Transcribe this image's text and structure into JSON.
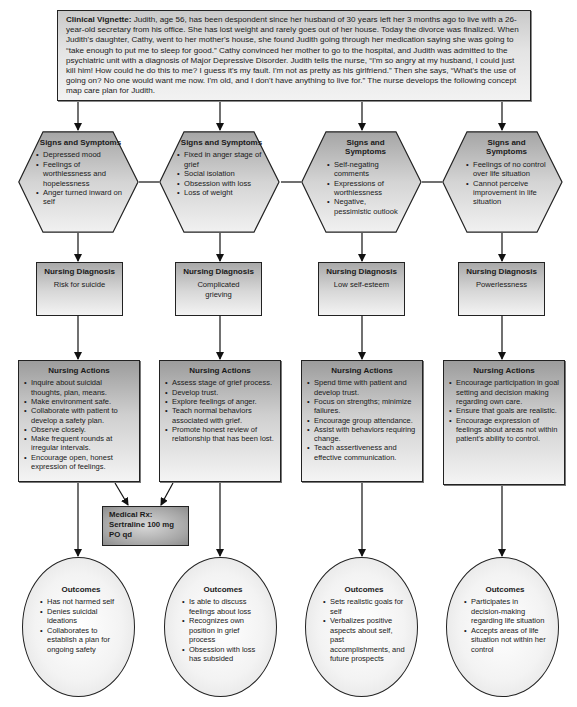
{
  "vignette": {
    "label": "Clinical Vignette:",
    "text": " Judith, age 56, has been despondent since her husband of 30 years left her 3 months ago to live with a 26-year-old secretary from his office. She has lost weight and rarely goes out of her house. Today the divorce was finalized. When Judith's daughter, Cathy, went to her mother's house, she found Judith going through her medication saying she was going to “take enough to put me to sleep for good.” Cathy convinced her mother to go to the hospital, and Judith was admitted to the psychiatric unit with a diagnosis of Major Depressive Disorder. Judith tells the nurse, “I'm so angry at my husband, I could just kill him! How could he do this to me? I guess it's my fault. I'm not as pretty as his girlfriend.” Then she says, “What's the use of going on? No one would want me now. I'm old, and I don't have anything to live for.” The nurse develops the following concept map care plan for Judith."
  },
  "columns": [
    {
      "signs": {
        "title": "Signs and Symptoms",
        "items": [
          "Depressed mood",
          "Feelings of worthlessness and hopelessness",
          "Anger turned inward on self"
        ]
      },
      "diagnosis": {
        "title": "Nursing Diagnosis",
        "text": "Risk for suicide"
      },
      "actions": {
        "title": "Nursing Actions",
        "items": [
          "Inquire about suicidal thoughts, plan, means.",
          "Make environment safe.",
          "Collaborate with patient to develop a safety plan.",
          "Observe closely.",
          "Make frequent rounds at irregular intervals.",
          "Encourage open, honest expression of feelings."
        ]
      },
      "outcomes": {
        "title": "Outcomes",
        "items": [
          "Has not harmed self",
          "Denies suicidal ideations",
          "Collaborates to establish a plan for ongoing safety"
        ]
      }
    },
    {
      "signs": {
        "title": "Signs and Symptoms",
        "items": [
          "Fixed in anger stage of grief",
          "Social isolation",
          "Obsession with loss",
          "Loss of weight"
        ]
      },
      "diagnosis": {
        "title": "Nursing Diagnosis",
        "text": "Complicated grieving"
      },
      "actions": {
        "title": "Nursing Actions",
        "items": [
          "Assess stage of grief process.",
          "Develop trust.",
          "Explore feelings of anger.",
          "Teach normal behaviors associated with grief.",
          "Promote honest review of relationship that has been lost."
        ]
      },
      "outcomes": {
        "title": "Outcomes",
        "items": [
          "Is able to discuss feelings about loss",
          "Recognizes own position in grief process",
          "Obsession with loss has subsided"
        ]
      }
    },
    {
      "signs": {
        "title": "Signs and Symptoms",
        "items": [
          "Self-negating comments",
          "Expressions of worthlessness",
          "Negative, pessimistic outlook"
        ]
      },
      "diagnosis": {
        "title": "Nursing Diagnosis",
        "text": "Low self-esteem"
      },
      "actions": {
        "title": "Nursing Actions",
        "items": [
          "Spend time with patient and develop trust.",
          "Focus on strengths; minimize failures.",
          "Encourage group attendance.",
          "Assist with behaviors requiring change.",
          "Teach assertiveness and effective communication."
        ]
      },
      "outcomes": {
        "title": "Outcomes",
        "items": [
          "Sets realistic goals for self",
          "Verbalizes positive aspects about self, past accomplishments, and future prospects"
        ]
      }
    },
    {
      "signs": {
        "title": "Signs and Symptoms",
        "items": [
          "Feelings of no control over life situation",
          "Cannot perceive improvement in life situation"
        ]
      },
      "diagnosis": {
        "title": "Nursing Diagnosis",
        "text": "Powerlessness"
      },
      "actions": {
        "title": "Nursing Actions",
        "items": [
          "Encourage participation in goal setting and decision making regarding own care.",
          "Ensure that goals are realistic.",
          "Encourage expression of feelings about areas not within patient's ability to control."
        ]
      },
      "outcomes": {
        "title": "Outcomes",
        "items": [
          "Participates in decision-making regarding life situation",
          "Accepts areas of life situation not within her control"
        ]
      }
    }
  ],
  "medical_rx": {
    "label": "Medical Rx:",
    "drug": "Sertraline 100 mg",
    "route": "PO qd"
  }
}
